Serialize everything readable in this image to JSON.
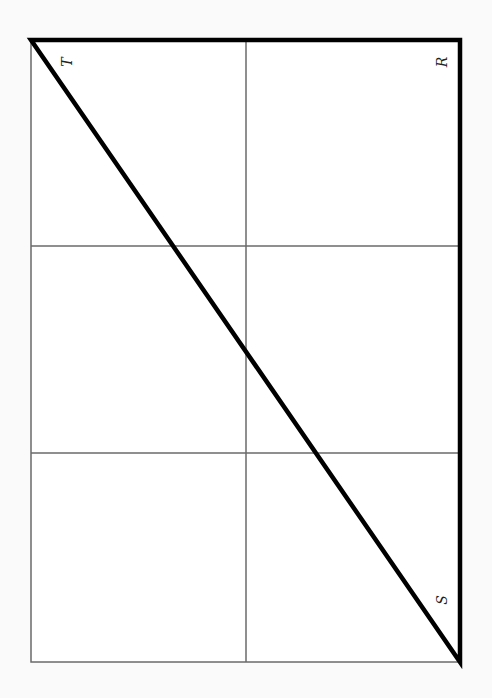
{
  "diagram": {
    "type": "right-triangle-on-grid",
    "rotation_deg": -90,
    "grid": {
      "columns": 2,
      "rows": 3,
      "line_color": "#6a6a6a"
    },
    "frame": {
      "left": 31,
      "top": 40,
      "right": 460,
      "bottom": 662
    },
    "grid_lines": {
      "vertical_x": [
        246
      ],
      "horizontal_y": [
        246,
        453
      ]
    },
    "triangle": {
      "stroke_color": "#000000",
      "vertices": [
        {
          "label": "T",
          "x": 31,
          "y": 40
        },
        {
          "label": "R",
          "x": 460,
          "y": 40
        },
        {
          "label": "S",
          "x": 460,
          "y": 662
        }
      ]
    },
    "labels": {
      "T": "T",
      "R": "R",
      "S": "S"
    }
  }
}
